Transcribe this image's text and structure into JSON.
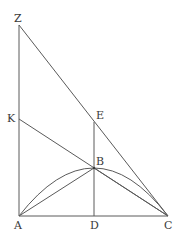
{
  "diagram": {
    "type": "geometric-figure",
    "labels": {
      "Z": "Z",
      "K": "K",
      "E": "E",
      "B": "B",
      "A": "A",
      "D": "D",
      "C": "C"
    },
    "segments": [
      [
        "Z",
        "A"
      ],
      [
        "Z",
        "C"
      ],
      [
        "K",
        "C"
      ],
      [
        "E",
        "D"
      ],
      [
        "A",
        "C"
      ],
      [
        "A",
        "B"
      ],
      [
        "B",
        "C"
      ]
    ],
    "arcs": [
      [
        "A",
        "B",
        "C"
      ]
    ],
    "colors": {
      "line": "#5a5a5a",
      "text": "#3a3a3a"
    }
  }
}
